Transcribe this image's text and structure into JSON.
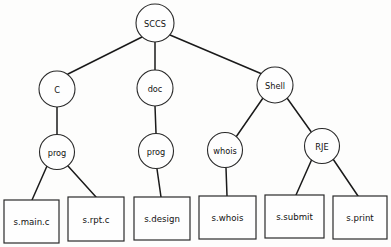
{
  "diagram": {
    "type": "tree-diagram",
    "background_color": "#fdfdfc",
    "line_color": "#1a1a1a",
    "node_fill": "#fefefe"
  },
  "nodes": {
    "root": {
      "label": "SCCS",
      "shape": "circle",
      "cx": 155,
      "cy": 23,
      "r": 19
    },
    "c": {
      "label": "C",
      "shape": "circle",
      "cx": 57,
      "cy": 89,
      "r": 18
    },
    "doc": {
      "label": "doc",
      "shape": "circle",
      "cx": 155,
      "cy": 88,
      "r": 18
    },
    "shell": {
      "label": "Shell",
      "shape": "circle",
      "cx": 275,
      "cy": 85,
      "r": 18
    },
    "prog_c": {
      "label": "prog",
      "shape": "circle",
      "cx": 57,
      "cy": 152,
      "r": 17.5
    },
    "prog_doc": {
      "label": "prog",
      "shape": "circle",
      "cx": 156,
      "cy": 151,
      "r": 17.5
    },
    "whois": {
      "label": "whois",
      "shape": "circle",
      "cx": 225,
      "cy": 150,
      "r": 17.5
    },
    "rje": {
      "label": "RJE",
      "shape": "circle",
      "cx": 322,
      "cy": 146,
      "r": 17.5
    }
  },
  "leaves": [
    {
      "label": "s.main.c",
      "x": 4,
      "y": 200,
      "w": 55,
      "h": 43
    },
    {
      "label": "s.rpt.c",
      "x": 68,
      "y": 197,
      "w": 56,
      "h": 44
    },
    {
      "label": "s.design",
      "x": 134,
      "y": 197,
      "w": 56,
      "h": 43
    },
    {
      "label": "s.whois",
      "x": 199,
      "y": 196,
      "w": 57,
      "h": 43
    },
    {
      "label": "s.submit",
      "x": 265,
      "y": 195,
      "w": 59,
      "h": 43
    },
    {
      "label": "s.print",
      "x": 333,
      "y": 196,
      "w": 54,
      "h": 43
    }
  ],
  "edges": [
    {
      "from": "SCCS",
      "to": "C",
      "x1": 142,
      "y1": 37,
      "x2": 68,
      "y2": 74
    },
    {
      "from": "SCCS",
      "to": "doc",
      "x1": 155,
      "y1": 42,
      "x2": 155,
      "y2": 70
    },
    {
      "from": "SCCS",
      "to": "Shell",
      "x1": 170,
      "y1": 35,
      "x2": 262,
      "y2": 74
    },
    {
      "from": "C",
      "to": "prog",
      "x1": 57,
      "y1": 107,
      "x2": 57,
      "y2": 134
    },
    {
      "from": "doc",
      "to": "prog",
      "x1": 155,
      "y1": 106,
      "x2": 156,
      "y2": 133
    },
    {
      "from": "Shell",
      "to": "whois",
      "x1": 263,
      "y1": 98,
      "x2": 236,
      "y2": 137
    },
    {
      "from": "Shell",
      "to": "RJE",
      "x1": 287,
      "y1": 98,
      "x2": 312,
      "y2": 133
    },
    {
      "from": "prog",
      "to": "s.main.c",
      "x1": 47,
      "y1": 166,
      "x2": 32,
      "y2": 200
    },
    {
      "from": "prog",
      "to": "s.rpt.c",
      "x1": 68,
      "y1": 166,
      "x2": 96,
      "y2": 197
    },
    {
      "from": "prog",
      "to": "s.design",
      "x1": 157,
      "y1": 169,
      "x2": 161,
      "y2": 197
    },
    {
      "from": "whois",
      "to": "s.whois",
      "x1": 226,
      "y1": 168,
      "x2": 227,
      "y2": 196
    },
    {
      "from": "RJE",
      "to": "s.submit",
      "x1": 312,
      "y1": 159,
      "x2": 296,
      "y2": 195
    },
    {
      "from": "RJE",
      "to": "s.print",
      "x1": 333,
      "y1": 159,
      "x2": 358,
      "y2": 196
    }
  ]
}
